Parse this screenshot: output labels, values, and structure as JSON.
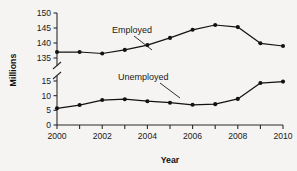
{
  "chart_data": {
    "type": "line",
    "title": "",
    "xlabel": "Year",
    "ylabel": "Millions",
    "x": [
      2000,
      2001,
      2002,
      2003,
      2004,
      2005,
      2006,
      2007,
      2008,
      2009,
      2010
    ],
    "xtick_labels": [
      "2000",
      "2002",
      "2004",
      "2006",
      "2008",
      "2010"
    ],
    "xtick_values": [
      2000,
      2002,
      2004,
      2006,
      2008,
      2010
    ],
    "xlim": [
      2000,
      2010
    ],
    "y_axis_broken": true,
    "y_lower_ticks": [
      0,
      5,
      10,
      15
    ],
    "y_upper_ticks": [
      135,
      140,
      145,
      150
    ],
    "ytick_labels": [
      "0",
      "5",
      "10",
      "15",
      "135",
      "140",
      "145",
      "150"
    ],
    "grid": false,
    "legend_position": "inline-annotations",
    "series": [
      {
        "name": "Employed",
        "axis": "upper",
        "values": [
          137.0,
          137.0,
          136.5,
          137.7,
          139.3,
          141.7,
          144.4,
          146.0,
          145.3,
          139.9,
          139.0
        ]
      },
      {
        "name": "Unemployed",
        "axis": "lower",
        "values": [
          5.7,
          6.8,
          8.5,
          8.8,
          8.1,
          7.6,
          6.9,
          7.1,
          8.9,
          14.3,
          14.8
        ]
      }
    ],
    "annotations": [
      {
        "label": "Employed",
        "for_series": "Employed"
      },
      {
        "label": "Unemployed",
        "for_series": "Unemployed"
      }
    ],
    "colors": {
      "line": "#121212",
      "marker": "#121212",
      "axis": "#2b2b2b",
      "background": "#f5f4f2",
      "text": "#1a1a1a"
    }
  }
}
